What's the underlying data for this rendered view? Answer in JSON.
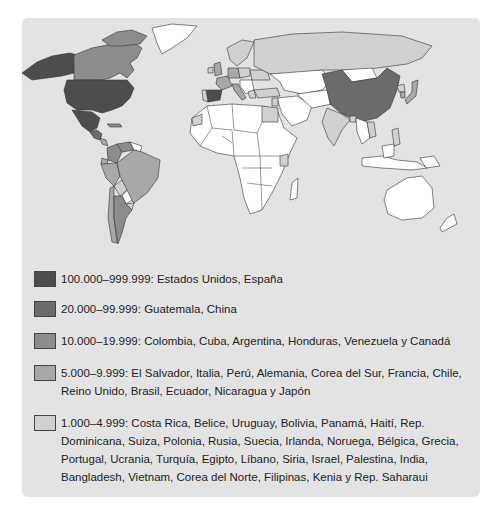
{
  "colors": {
    "background": "#e3e3e3",
    "level_100k": "#4d4d4d",
    "level_20k": "#6b6b6b",
    "level_10k": "#8c8c8c",
    "level_5k": "#a8a8a8",
    "level_1k": "#d0d0d0",
    "other": "#ffffff"
  },
  "legend": [
    {
      "range": "100.000–999.999",
      "label": "100.000–999.999: Estados Unidos, España",
      "countries": [
        "Estados Unidos",
        "España"
      ],
      "color": "#4d4d4d"
    },
    {
      "range": "20.000–99.999",
      "label": "20.000–99.999: Guatemala, China",
      "countries": [
        "Guatemala",
        "China"
      ],
      "color": "#6b6b6b"
    },
    {
      "range": "10.000–19.999",
      "label": "10.000–19.999: Colombia, Cuba, Argentina, Honduras, Venezuela y Canadá",
      "countries": [
        "Colombia",
        "Cuba",
        "Argentina",
        "Honduras",
        "Venezuela",
        "Canadá"
      ],
      "color": "#8c8c8c"
    },
    {
      "range": "5.000–9.999",
      "label": "5.000–9.999: El Salvador, Italia, Perú, Alemania, Corea del Sur, Francia, Chile, Reino Unido, Brasil, Ecuador, Nicaragua y Japón",
      "countries": [
        "El Salvador",
        "Italia",
        "Perú",
        "Alemania",
        "Corea del Sur",
        "Francia",
        "Chile",
        "Reino Unido",
        "Brasil",
        "Ecuador",
        "Nicaragua",
        "Japón"
      ],
      "color": "#a8a8a8"
    },
    {
      "range": "1.000–4.999",
      "label": "1.000–4.999: Costa Rica, Belice, Uruguay, Bolivia, Panamá, Haití, Rep. Dominicana, Suiza, Polonia, Rusia, Suecia, Irlanda, Noruega, Bélgica, Grecia, Portugal, Ucrania, Turquía, Egipto, Líbano, Siria, Israel, Palestina, India, Bangladesh, Vietnam, Corea del Norte, Filipinas, Kenia y Rep. Saharaui",
      "countries": [
        "Costa Rica",
        "Belice",
        "Uruguay",
        "Bolivia",
        "Panamá",
        "Haití",
        "Rep. Dominicana",
        "Suiza",
        "Polonia",
        "Rusia",
        "Suecia",
        "Irlanda",
        "Noruega",
        "Bélgica",
        "Grecia",
        "Portugal",
        "Ucrania",
        "Turquía",
        "Egipto",
        "Líbano",
        "Siria",
        "Israel",
        "Palestina",
        "India",
        "Bangladesh",
        "Vietnam",
        "Corea del Norte",
        "Filipinas",
        "Kenia",
        "Rep. Saharaui"
      ],
      "color": "#d0d0d0"
    }
  ]
}
